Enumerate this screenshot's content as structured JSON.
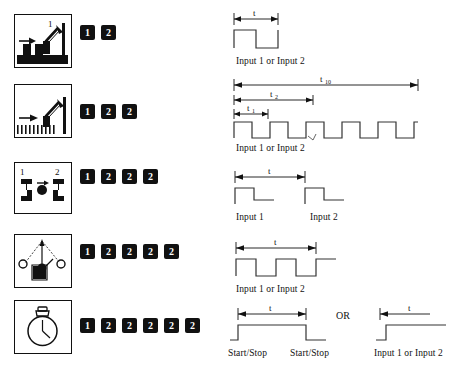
{
  "page": {
    "background": "#ffffff",
    "ink": "#111111",
    "wave_color": "#333333"
  },
  "or_label": "OR",
  "rows": [
    {
      "id": "row-1",
      "icon_name": "part-on-conveyor-sensor-icon",
      "badges": [
        "1",
        "2"
      ],
      "waveforms": [
        {
          "name": "single-pulse-waveform",
          "caption": "Input 1 or  Input 2",
          "dimensions": [
            {
              "label": "t",
              "sub": ""
            }
          ]
        }
      ]
    },
    {
      "id": "row-2",
      "icon_name": "toothed-rack-sensor-icon",
      "badges": [
        "1",
        "2",
        "2"
      ],
      "waveforms": [
        {
          "name": "pulse-train-waveform",
          "caption": "Input 1 or  Input 2",
          "dimensions": [
            {
              "label": "t",
              "sub": "10"
            },
            {
              "label": "t",
              "sub": "2"
            },
            {
              "label": "t",
              "sub": "1"
            }
          ]
        }
      ]
    },
    {
      "id": "row-3",
      "icon_name": "two-sensor-gate-icon",
      "badges": [
        "1",
        "2",
        "2",
        "2"
      ],
      "waveforms": [
        {
          "name": "two-input-interval-waveform",
          "caption_left": "Input 1",
          "caption_right": "Input 2",
          "dimensions": [
            {
              "label": "t",
              "sub": ""
            }
          ]
        }
      ]
    },
    {
      "id": "row-4",
      "icon_name": "pendulum-swing-sensor-icon",
      "badges": [
        "1",
        "2",
        "2",
        "2",
        "2"
      ],
      "waveforms": [
        {
          "name": "double-pulse-period-waveform",
          "caption": "Input 1 or  Input 2",
          "dimensions": [
            {
              "label": "t",
              "sub": ""
            }
          ]
        }
      ]
    },
    {
      "id": "row-5",
      "icon_name": "stopwatch-icon",
      "badges": [
        "1",
        "2",
        "2",
        "2",
        "2",
        "2"
      ],
      "waveforms": [
        {
          "name": "start-stop-gate-waveform",
          "caption_left": "Start/Stop",
          "caption_right": "Start/Stop",
          "dimensions": [
            {
              "label": "t",
              "sub": ""
            }
          ]
        },
        {
          "name": "single-edge-waveform",
          "caption": "Input 1 or  Input 2",
          "dimensions": [
            {
              "label": "t",
              "sub": ""
            }
          ]
        }
      ]
    }
  ],
  "icon_numbers": {
    "row1_pointer": "1",
    "row3_left": "1",
    "row3_right": "2"
  }
}
